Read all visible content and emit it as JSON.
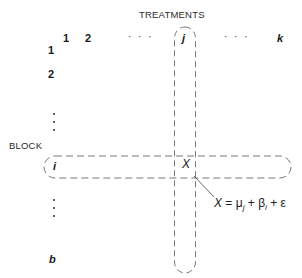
{
  "diagram": {
    "title": "TREATMENTS",
    "row_axis_label": "BLOCK",
    "column_labels": [
      {
        "text": "1",
        "x": 63,
        "y": 33
      },
      {
        "text": "2",
        "x": 85,
        "y": 33
      },
      {
        "text": "· · ·",
        "x": 128,
        "y": 33
      },
      {
        "text": "j",
        "x": 181,
        "y": 33
      },
      {
        "text": "· · ·",
        "x": 224,
        "y": 33
      },
      {
        "text": "k",
        "x": 277,
        "y": 33
      }
    ],
    "row_labels": [
      {
        "text": "1",
        "x": 48,
        "y": 44
      },
      {
        "text": "2",
        "x": 48,
        "y": 68
      },
      {
        "text": "i",
        "x": 53,
        "y": 160
      },
      {
        "text": "b",
        "x": 48,
        "y": 253
      }
    ],
    "vertical_ellipsis_rows": [
      {
        "x": 53,
        "y": 113
      },
      {
        "x": 53,
        "y": 198
      }
    ],
    "highlighted_column": "j",
    "highlighted_row": "i",
    "cell_value": "X",
    "formula": {
      "lhs": "X",
      "equals": "=",
      "terms": [
        {
          "symbol": "μ",
          "subscript": "j"
        },
        {
          "symbol": "β",
          "subscript": "i"
        },
        {
          "symbol": "ε",
          "subscript": ""
        }
      ],
      "operator": "+"
    },
    "colors": {
      "ink": "#1a1a1a",
      "dash": "#6a6a6a",
      "background": "#ffffff"
    }
  }
}
